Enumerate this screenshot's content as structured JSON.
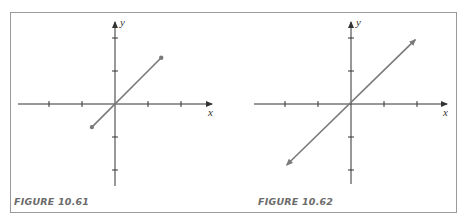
{
  "figures": [
    {
      "caption": "FIGURE 10.61",
      "x_label": "x",
      "y_label": "y",
      "ticks": [
        -2,
        -1,
        1,
        2
      ],
      "shape": "segment",
      "endpoints": [
        [
          -0.7,
          -0.7
        ],
        [
          1.4,
          1.4
        ]
      ],
      "endpoint_style": "dots"
    },
    {
      "caption": "FIGURE 10.62",
      "x_label": "x",
      "y_label": "y",
      "ticks": [
        -2,
        -1,
        1,
        2
      ],
      "shape": "line",
      "endpoints": [
        [
          -1.95,
          -1.85
        ],
        [
          1.95,
          1.95
        ]
      ],
      "endpoint_style": "arrows"
    }
  ],
  "colors": {
    "axis": "#333333",
    "graph": "#7a7a7a",
    "caption": "#6b6b6b",
    "frame": "#9a9a9a"
  }
}
